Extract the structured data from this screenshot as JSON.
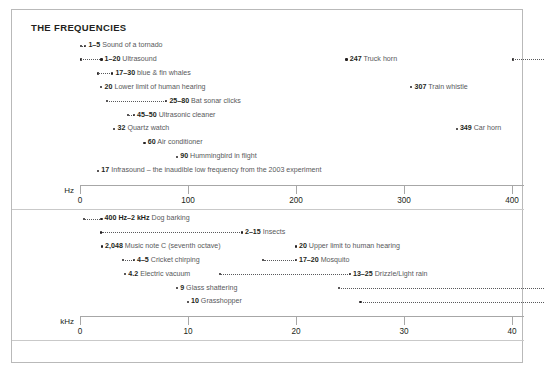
{
  "title": "THE FREQUENCIES",
  "chart_data": {
    "type": "scatter",
    "title": "THE FREQUENCIES",
    "grid": false,
    "legend": null,
    "panels": [
      {
        "name": "hz-panel",
        "unit": "Hz",
        "xlabel": "Hz",
        "xlim": [
          0,
          430
        ],
        "ticks": [
          0,
          100,
          200,
          300,
          400
        ],
        "ticklabels": [
          "0",
          "100",
          "200",
          "300",
          "400"
        ],
        "entries": [
          {
            "value": "1–5",
            "label": "Sound of a tornado",
            "x0": 1,
            "x1": 5,
            "row": 0
          },
          {
            "value": "1–20",
            "label": "Ultrasound",
            "x0": 1,
            "x1": 20,
            "row": 1
          },
          {
            "value": "17–30",
            "label": "blue & fin whales",
            "x0": 17,
            "x1": 30,
            "row": 2
          },
          {
            "value": "20",
            "label": "Lower limit of human hearing",
            "x0": 20,
            "x1": 20,
            "row": 3
          },
          {
            "value": "25–80",
            "label": "Bat sonar clicks",
            "x0": 25,
            "x1": 80,
            "row": 4
          },
          {
            "value": "45–50",
            "label": "Ultrasonic cleaner",
            "x0": 45,
            "x1": 50,
            "row": 5
          },
          {
            "value": "32",
            "label": "Quartz watch",
            "x0": 32,
            "x1": 32,
            "row": 6
          },
          {
            "value": "60",
            "label": "Air conditioner",
            "x0": 60,
            "x1": 60,
            "row": 7
          },
          {
            "value": "90",
            "label": "Hummingbird in flight",
            "x0": 90,
            "x1": 90,
            "row": 8
          },
          {
            "value": "17",
            "label": "Infrasound – the inaudible low frequency from the 2003 experiment",
            "x0": 17,
            "x1": 17,
            "row": 9
          },
          {
            "value": "247",
            "label": "Truck horn",
            "x0": 247,
            "x1": 247,
            "row": 1
          },
          {
            "value": "307",
            "label": "Train whistle",
            "x0": 307,
            "x1": 307,
            "row": 3
          },
          {
            "value": "349",
            "label": "Car horn",
            "x0": 349,
            "x1": 349,
            "row": 6
          }
        ],
        "unlabeled_ranges": [
          {
            "x0": 401,
            "x1": 430,
            "row": 1
          }
        ]
      },
      {
        "name": "khz-panel",
        "unit": "kHz",
        "xlabel": "kHz",
        "xlim": [
          0,
          43
        ],
        "ticks": [
          0,
          10,
          20,
          30,
          40
        ],
        "ticklabels": [
          "0",
          "10",
          "20",
          "30",
          "40"
        ],
        "entries": [
          {
            "value": "400 Hz–2 kHz",
            "label": "Dog barking",
            "x0": 0.4,
            "x1": 2,
            "row": 0
          },
          {
            "value": "2–15",
            "label": "Insects",
            "x0": 2,
            "x1": 15,
            "row": 1
          },
          {
            "value": "2,048",
            "label": "Music note C (seventh octave)",
            "x0": 2.048,
            "x1": 2.048,
            "row": 2
          },
          {
            "value": "4–5",
            "label": "Cricket chirping",
            "x0": 4,
            "x1": 5,
            "row": 3
          },
          {
            "value": "4.2",
            "label": "Electric vacuum",
            "x0": 4.2,
            "x1": 4.2,
            "row": 4
          },
          {
            "value": "9",
            "label": "Glass shattering",
            "x0": 9,
            "x1": 9,
            "row": 5
          },
          {
            "value": "10",
            "label": "Grasshopper",
            "x0": 10,
            "x1": 10,
            "row": 6
          },
          {
            "value": "20",
            "label": "Upper limit to human hearing",
            "x0": 20,
            "x1": 20,
            "row": 2
          },
          {
            "value": "17–20",
            "label": "Mosquito",
            "x0": 17,
            "x1": 20,
            "row": 3
          },
          {
            "value": "13–25",
            "label": "Drizzle/Light rain",
            "x0": 13,
            "x1": 25,
            "row": 4
          }
        ],
        "unlabeled_ranges": [
          {
            "x0": 24,
            "x1": 43,
            "row": 5
          },
          {
            "x0": 26,
            "x1": 43,
            "row": 6
          }
        ]
      }
    ]
  }
}
